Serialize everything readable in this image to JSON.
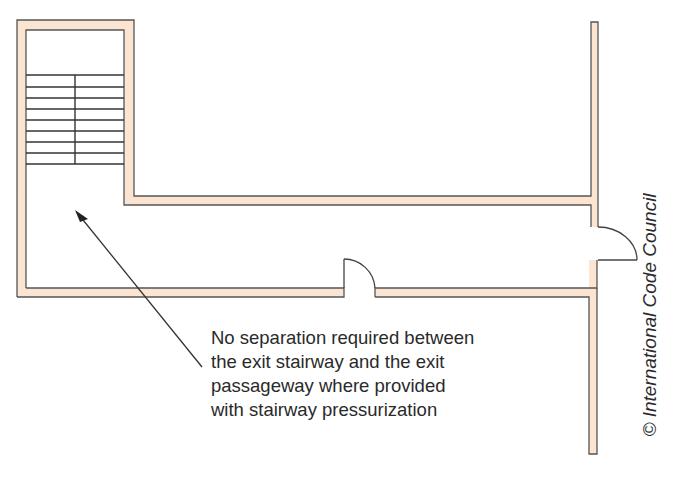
{
  "figure": {
    "type": "floor-plan",
    "colors": {
      "wall_fill": "#fbe5d2",
      "wall_stroke": "#555555",
      "line": "#333333",
      "background": "#ffffff"
    },
    "elements": {
      "stairway": {
        "treads": 9,
        "has_center_divider": true
      },
      "doors": [
        "corridor-door",
        "end-door"
      ]
    },
    "annotation": {
      "lines": [
        "No separation required between",
        "the exit stairway and the exit",
        "passageway where provided",
        "with stairway pressurization"
      ]
    },
    "credit": "© International Code Council"
  }
}
